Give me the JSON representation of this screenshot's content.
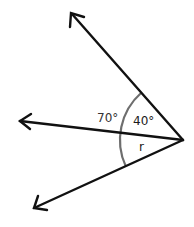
{
  "diagram": {
    "type": "angles-at-a-point",
    "vertex": {
      "x": 183,
      "y": 140
    },
    "rays": [
      {
        "name": "upper-ray",
        "tip": {
          "x": 71,
          "y": 13
        }
      },
      {
        "name": "middle-ray",
        "tip": {
          "x": 19,
          "y": 121
        }
      },
      {
        "name": "lower-ray",
        "tip": {
          "x": 33,
          "y": 209
        }
      }
    ],
    "arc": {
      "radius": 63,
      "color": "#6e6e6e"
    },
    "labels": {
      "outer_angle": "70°",
      "upper_angle": "40°",
      "lower_angle": "r"
    },
    "colors": {
      "ray": "#111111",
      "arc": "#6e6e6e",
      "background": "#ffffff"
    }
  }
}
